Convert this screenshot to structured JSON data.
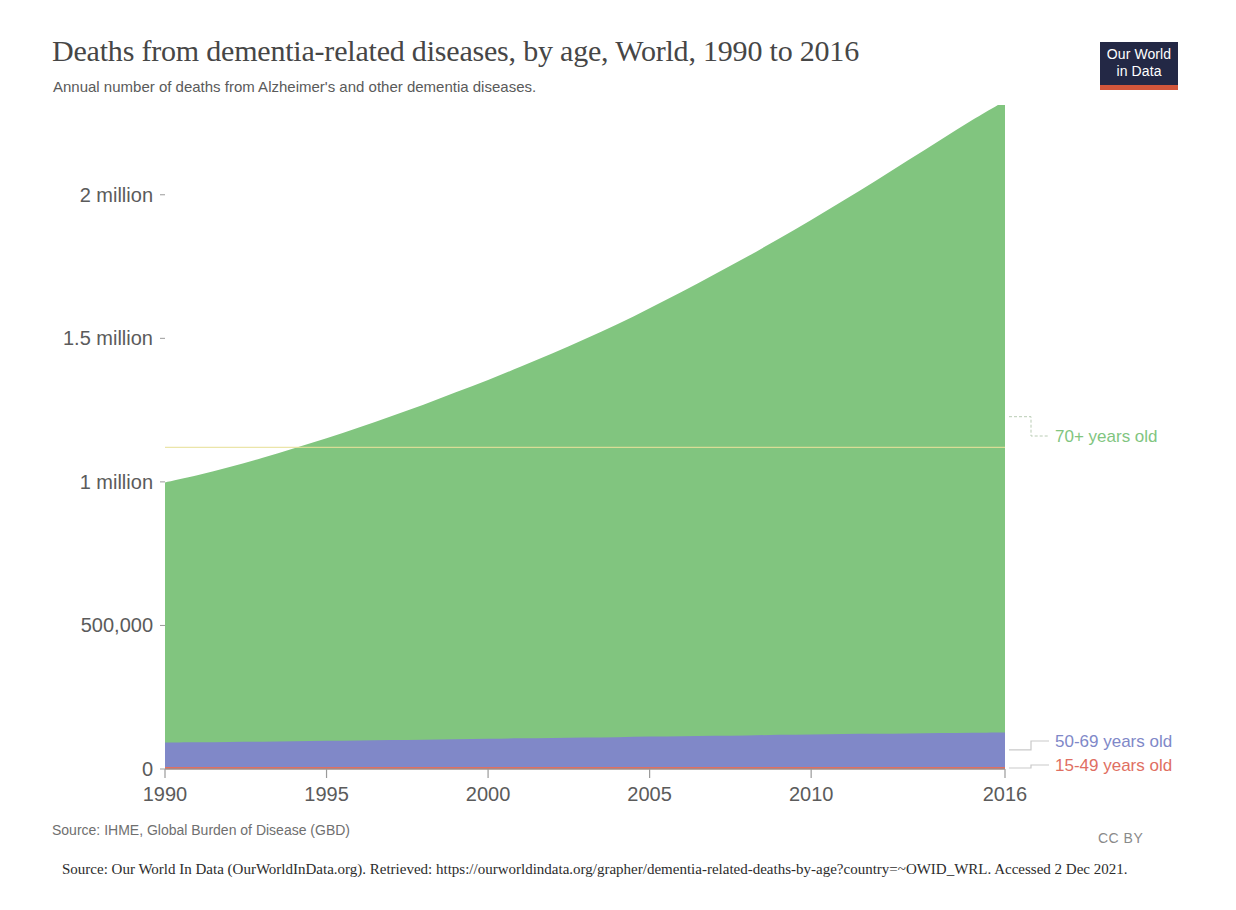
{
  "header": {
    "title": "Deaths from dementia-related diseases, by age, World, 1990 to 2016",
    "subtitle": "Annual number of deaths from Alzheimer's and other dementia diseases.",
    "logo_line1": "Our World",
    "logo_line2": "in Data"
  },
  "footer": {
    "source": "Source: IHME, Global Burden of Disease (GBD)",
    "license": "CC BY",
    "citation": "Source:  Our World In Data (OurWorldInData.org). Retrieved: https://ourworldindata.org/grapher/dementia-related-deaths-by-age?country=~OWID_WRL. Accessed 2 Dec 2021."
  },
  "chart_data": {
    "type": "area",
    "stacked": true,
    "title": "Deaths from dementia-related diseases, by age, World, 1990 to 2016",
    "subtitle": "Annual number of deaths from Alzheimer's and other dementia diseases.",
    "xlabel": "",
    "ylabel": "",
    "grid": false,
    "legend_position": "right",
    "xlim": [
      1990,
      2016
    ],
    "ylim": [
      0,
      2250000
    ],
    "x": [
      1990,
      1991,
      1992,
      1993,
      1994,
      1995,
      1996,
      1997,
      1998,
      1999,
      2000,
      2001,
      2002,
      2003,
      2004,
      2005,
      2006,
      2007,
      2008,
      2009,
      2010,
      2011,
      2012,
      2013,
      2014,
      2015,
      2016
    ],
    "xticks": [
      1990,
      1995,
      2000,
      2005,
      2010,
      2016
    ],
    "xtick_labels": [
      "1990",
      "1995",
      "2000",
      "2005",
      "2010",
      "2016"
    ],
    "yticks": [
      0,
      500000,
      1000000,
      1500000,
      2000000
    ],
    "ytick_labels": [
      "0",
      "500,000",
      "1 million",
      "1.5 million",
      "2 million"
    ],
    "series": [
      {
        "name": "15-49 years old",
        "color": "#e06f62",
        "legend_label": "15-49 years old",
        "values": [
          7000,
          7000,
          7000,
          7000,
          7000,
          7000,
          7000,
          7000,
          7000,
          7000,
          7000,
          7000,
          7000,
          7000,
          7000,
          7000,
          7000,
          7000,
          7000,
          7000,
          7000,
          7000,
          7000,
          7000,
          7000,
          7000,
          7000
        ]
      },
      {
        "name": "50-69 years old",
        "color": "#8088c8",
        "legend_label": "50-69 years old",
        "values": [
          85000,
          86000,
          87000,
          88000,
          90000,
          91000,
          92000,
          94000,
          95000,
          97000,
          98000,
          100000,
          101000,
          103000,
          104000,
          106000,
          107000,
          109000,
          110000,
          112000,
          113000,
          115000,
          116000,
          117000,
          118000,
          119000,
          120000
        ]
      },
      {
        "name": "70+ years old",
        "color": "#81c57f",
        "legend_label": "70+ years old",
        "values": [
          906000,
          930000,
          958000,
          988000,
          1020000,
          1054000,
          1090000,
          1128000,
          1167000,
          1208000,
          1250000,
          1294000,
          1340000,
          1388000,
          1438000,
          1492000,
          1548000,
          1606000,
          1666000,
          1728000,
          1792000,
          1858000,
          1926000,
          1996000,
          2066000,
          2135000,
          2200000
        ]
      }
    ],
    "annotation_line": {
      "label": "",
      "color": "#e8e09a",
      "y": 1120000
    }
  }
}
